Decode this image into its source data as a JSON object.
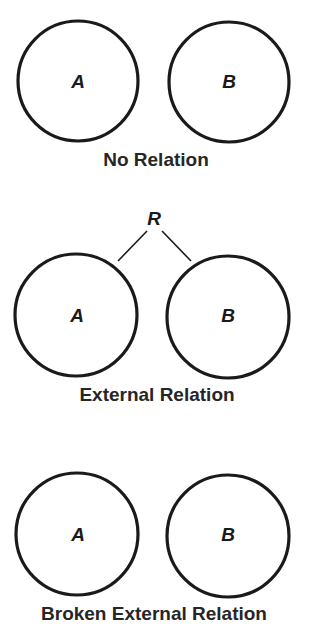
{
  "colors": {
    "stroke": "#1a1a1a",
    "text": "#262626",
    "background": "#ffffff"
  },
  "panels": [
    {
      "caption": "No Relation",
      "left_set": "A",
      "right_set": "B"
    },
    {
      "caption": "External Relation",
      "relation_label": "R",
      "left_set": "A",
      "right_set": "B"
    },
    {
      "caption": "Broken External Relation",
      "left_set": "A",
      "right_set": "B"
    }
  ]
}
